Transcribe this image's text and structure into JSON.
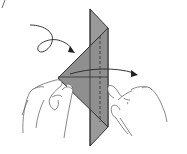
{
  "diagram": {
    "title": "Origami folding step",
    "paper_color": "#9a9a9a",
    "paper_shade_color": "#8c8c8c",
    "line_color": "#222222",
    "hand_line_color": "#555555",
    "elements": {
      "paper_strip": "vertical folded strip",
      "paper_flap": "triangular flap",
      "center_crease": "solid crease",
      "dashed_crease": "valley fold line",
      "horizontal_crease": "horizontal crease",
      "curl_arrow": "turn-over arrow",
      "fold_arrow": "fold across arrow",
      "left_hand": "left hand holding flap",
      "right_hand": "right hand holding strip"
    }
  }
}
